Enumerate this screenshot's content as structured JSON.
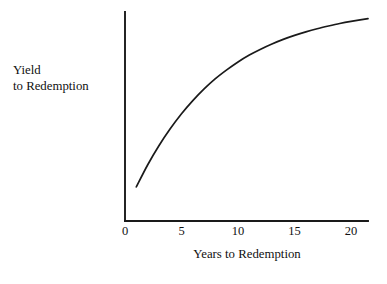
{
  "chart_data": {
    "type": "line",
    "title": "",
    "xlabel": "Years to Redemption",
    "ylabel_line1": "Yield",
    "ylabel_line2": "to Redemption",
    "xlim": [
      0,
      21.5
    ],
    "ylim": [
      0,
      1
    ],
    "grid": false,
    "legend": null,
    "xticks": [
      0,
      5,
      10,
      15,
      20
    ],
    "xtick_labels": [
      "0",
      "5",
      "10",
      "15",
      "20"
    ],
    "yticks": [],
    "ytick_labels": [],
    "axis_color": "#1a1a1a",
    "curve_color": "#1a1a1a",
    "background": "#ffffff",
    "series": [
      {
        "name": "yield-curve",
        "x": [
          1.0,
          2.0,
          3.0,
          4.0,
          5.0,
          6.0,
          7.0,
          8.0,
          9.0,
          10.0,
          11.0,
          12.0,
          13.0,
          14.0,
          15.0,
          16.0,
          17.0,
          18.0,
          19.0,
          20.0,
          21.5
        ],
        "y": [
          0.163,
          0.268,
          0.36,
          0.441,
          0.513,
          0.576,
          0.632,
          0.681,
          0.723,
          0.761,
          0.794,
          0.822,
          0.847,
          0.869,
          0.888,
          0.905,
          0.92,
          0.933,
          0.945,
          0.955,
          0.968
        ]
      }
    ]
  },
  "geometry": {
    "plot_left": 125,
    "plot_right": 368,
    "plot_top": 12,
    "plot_bottom": 221
  }
}
